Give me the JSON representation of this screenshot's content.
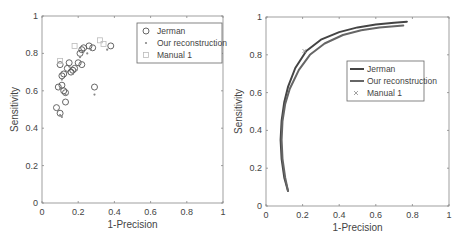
{
  "chart_data": [
    {
      "type": "scatter",
      "title": "",
      "xlabel": "1-Precision",
      "ylabel": "Sensitivity",
      "xlim": [
        0,
        1
      ],
      "ylim": [
        0,
        1
      ],
      "xticks": [
        "0",
        "0.2",
        "0.4",
        "0.6",
        "0.8",
        "1"
      ],
      "yticks": [
        "0",
        "0.2",
        "0.4",
        "0.6",
        "0.8",
        "1"
      ],
      "grid": false,
      "legend_position": "upper-right",
      "series": [
        {
          "name": "Jerman",
          "marker": "circle",
          "color": "#555555",
          "points": [
            [
              0.08,
              0.51
            ],
            [
              0.1,
              0.48
            ],
            [
              0.09,
              0.62
            ],
            [
              0.1,
              0.74
            ],
            [
              0.11,
              0.68
            ],
            [
              0.11,
              0.63
            ],
            [
              0.12,
              0.6
            ],
            [
              0.13,
              0.59
            ],
            [
              0.13,
              0.54
            ],
            [
              0.12,
              0.69
            ],
            [
              0.14,
              0.72
            ],
            [
              0.15,
              0.75
            ],
            [
              0.16,
              0.7
            ],
            [
              0.17,
              0.71
            ],
            [
              0.18,
              0.72
            ],
            [
              0.2,
              0.75
            ],
            [
              0.21,
              0.8
            ],
            [
              0.22,
              0.82
            ],
            [
              0.23,
              0.83
            ],
            [
              0.22,
              0.74
            ],
            [
              0.26,
              0.84
            ],
            [
              0.28,
              0.83
            ],
            [
              0.29,
              0.62
            ],
            [
              0.38,
              0.84
            ]
          ]
        },
        {
          "name": "Our reconstruction",
          "marker": "dot",
          "color": "#888888",
          "points": [
            [
              0.1,
              0.47
            ],
            [
              0.11,
              0.46
            ],
            [
              0.1,
              0.61
            ],
            [
              0.11,
              0.66
            ],
            [
              0.13,
              0.58
            ],
            [
              0.14,
              0.7
            ],
            [
              0.15,
              0.73
            ],
            [
              0.17,
              0.69
            ],
            [
              0.19,
              0.71
            ],
            [
              0.21,
              0.78
            ],
            [
              0.23,
              0.81
            ],
            [
              0.25,
              0.8
            ],
            [
              0.27,
              0.82
            ],
            [
              0.29,
              0.58
            ],
            [
              0.36,
              0.82
            ]
          ]
        },
        {
          "name": "Manual 1",
          "marker": "square",
          "color": "#bbbbbb",
          "points": [
            [
              0.18,
              0.84
            ],
            [
              0.1,
              0.76
            ],
            [
              0.32,
              0.87
            ],
            [
              0.34,
              0.85
            ]
          ]
        }
      ]
    },
    {
      "type": "line",
      "title": "",
      "xlabel": "1-Precision",
      "ylabel": "Sensitivity",
      "xlim": [
        0,
        1
      ],
      "ylim": [
        0,
        1
      ],
      "xticks": [
        "0",
        "0.2",
        "0.4",
        "0.6",
        "0.8",
        "1"
      ],
      "yticks": [
        "0",
        "0.2",
        "0.4",
        "0.6",
        "0.8",
        "1"
      ],
      "grid": false,
      "legend_position": "center-right",
      "series": [
        {
          "name": "Jerman",
          "color": "#444444",
          "points": [
            [
              0.12,
              0.08
            ],
            [
              0.1,
              0.15
            ],
            [
              0.085,
              0.25
            ],
            [
              0.08,
              0.35
            ],
            [
              0.085,
              0.45
            ],
            [
              0.1,
              0.55
            ],
            [
              0.12,
              0.63
            ],
            [
              0.16,
              0.73
            ],
            [
              0.22,
              0.82
            ],
            [
              0.3,
              0.88
            ],
            [
              0.4,
              0.92
            ],
            [
              0.5,
              0.945
            ],
            [
              0.6,
              0.96
            ],
            [
              0.7,
              0.97
            ],
            [
              0.77,
              0.975
            ]
          ]
        },
        {
          "name": "Our reconstruction",
          "color": "#666666",
          "points": [
            [
              0.12,
              0.08
            ],
            [
              0.105,
              0.15
            ],
            [
              0.09,
              0.25
            ],
            [
              0.085,
              0.35
            ],
            [
              0.09,
              0.45
            ],
            [
              0.105,
              0.54
            ],
            [
              0.13,
              0.62
            ],
            [
              0.18,
              0.72
            ],
            [
              0.24,
              0.8
            ],
            [
              0.32,
              0.86
            ],
            [
              0.42,
              0.905
            ],
            [
              0.52,
              0.93
            ],
            [
              0.62,
              0.945
            ],
            [
              0.75,
              0.955
            ]
          ]
        },
        {
          "name": "Manual 1",
          "marker": "x",
          "color": "#999999",
          "points": [
            [
              0.21,
              0.82
            ]
          ]
        }
      ]
    }
  ]
}
